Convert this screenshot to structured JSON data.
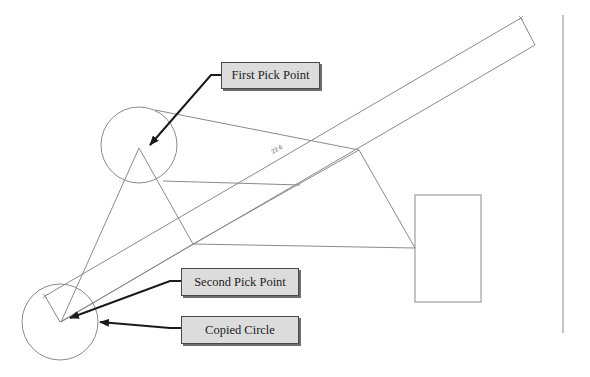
{
  "diagram": {
    "callouts": [
      {
        "id": "first",
        "label": "First Pick Point"
      },
      {
        "id": "second",
        "label": "Second Pick Point"
      },
      {
        "id": "copied",
        "label": "Copied Circle"
      }
    ],
    "dimension_label": "22.6",
    "colors": {
      "geometry_line": "#8a8a8a",
      "arrow": "#1a1a1a",
      "callout_fill": "#dcdcdc",
      "callout_border": "#4a4a4a"
    }
  }
}
